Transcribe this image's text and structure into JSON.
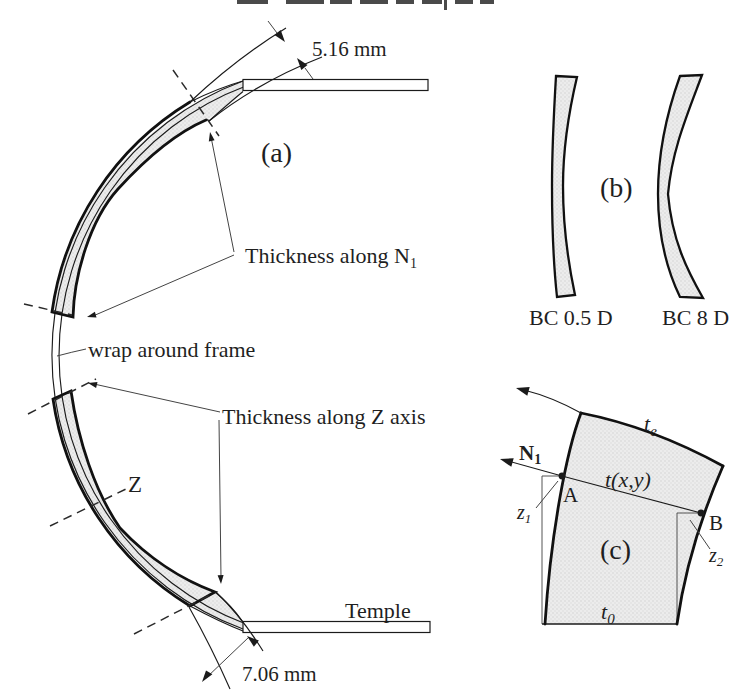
{
  "colors": {
    "line": "#1b1b1b",
    "lens_fill": "#eaeaea",
    "halftone_dot": "#d4d4d4",
    "paper": "#ffffff"
  },
  "panel_a": {
    "label": "(a)",
    "top_thickness": "5.16 mm",
    "bottom_thickness": "7.06 mm",
    "thickness_n": {
      "main": "Thickness along N",
      "sub": "1"
    },
    "wrap_frame": "wrap around frame",
    "thickness_z": "Thickness along Z axis",
    "z_axis": "Z",
    "temple": "Temple"
  },
  "panel_b": {
    "label": "(b)",
    "left_caption": "BC 0.5 D",
    "right_caption": "BC 8 D"
  },
  "panel_c": {
    "label": "(c)",
    "edge_thickness": {
      "main": "t",
      "sub": "e"
    },
    "local_thickness": "t(x,y)",
    "center_thickness": {
      "main": "t",
      "sub": "0"
    },
    "normal_vector": {
      "main": "N",
      "sub": "1"
    },
    "sag_left": {
      "main": "z",
      "sub": "1"
    },
    "sag_right": {
      "main": "z",
      "sub": "2"
    },
    "point_a": "A",
    "point_b": "B"
  }
}
